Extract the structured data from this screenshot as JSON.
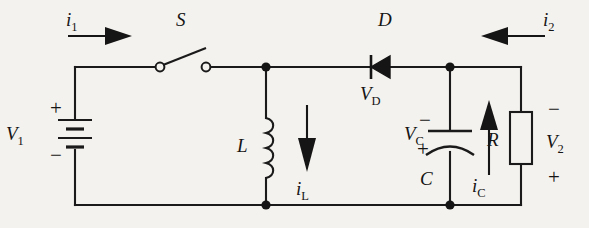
{
  "figure": {
    "name": "dc-dc-converter-circuit",
    "background_color": "#f4f2ee",
    "ink_color": "#151515"
  },
  "labels": {
    "current_in": {
      "symbol": "i",
      "sub": "1",
      "text": "i1"
    },
    "current_out": {
      "symbol": "i",
      "sub": "2",
      "text": "i2"
    },
    "switch": {
      "text": "S"
    },
    "diode": {
      "text": "D"
    },
    "diode_voltage": {
      "symbol": "V",
      "sub": "D",
      "text": "VD"
    },
    "inductor": {
      "text": "L"
    },
    "inductor_current": {
      "symbol": "i",
      "sub": "L",
      "text": "iL"
    },
    "capacitor": {
      "text": "C"
    },
    "capacitor_voltage": {
      "symbol": "V",
      "sub": "C",
      "text": "VC"
    },
    "capacitor_current": {
      "symbol": "i",
      "sub": "C",
      "text": "iC"
    },
    "resistor": {
      "text": "R"
    },
    "source_voltage": {
      "symbol": "V",
      "sub": "1",
      "text": "V1"
    },
    "output_voltage": {
      "symbol": "V",
      "sub": "2",
      "text": "V2"
    },
    "polarity": {
      "plus": "+",
      "minus": "−"
    },
    "source_plus": "+",
    "source_minus": "−",
    "cap_minus": "−",
    "cap_plus": "+",
    "output_minus": "−",
    "output_plus": "+"
  }
}
